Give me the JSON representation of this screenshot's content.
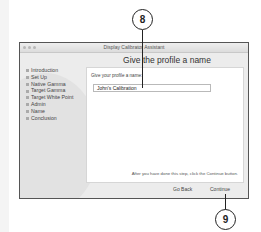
{
  "window": {
    "title": "Display Calibrator Assistant",
    "heading": "Give the profile a name"
  },
  "sidebar": {
    "steps": [
      {
        "label": "Introduction"
      },
      {
        "label": "Set Up"
      },
      {
        "label": "Native Gamma"
      },
      {
        "label": "Target Gamma"
      },
      {
        "label": "Target White Point"
      },
      {
        "label": "Admin"
      },
      {
        "label": "Name"
      },
      {
        "label": "Conclusion"
      }
    ]
  },
  "panel": {
    "prompt": "Give your profile a name:",
    "name_value": "John's Calibration",
    "hint": "After you have done this step, click the Continue button."
  },
  "buttons": {
    "go_back": "Go Back",
    "continue": "Continue"
  },
  "callouts": [
    {
      "number": "8"
    },
    {
      "number": "9"
    }
  ]
}
